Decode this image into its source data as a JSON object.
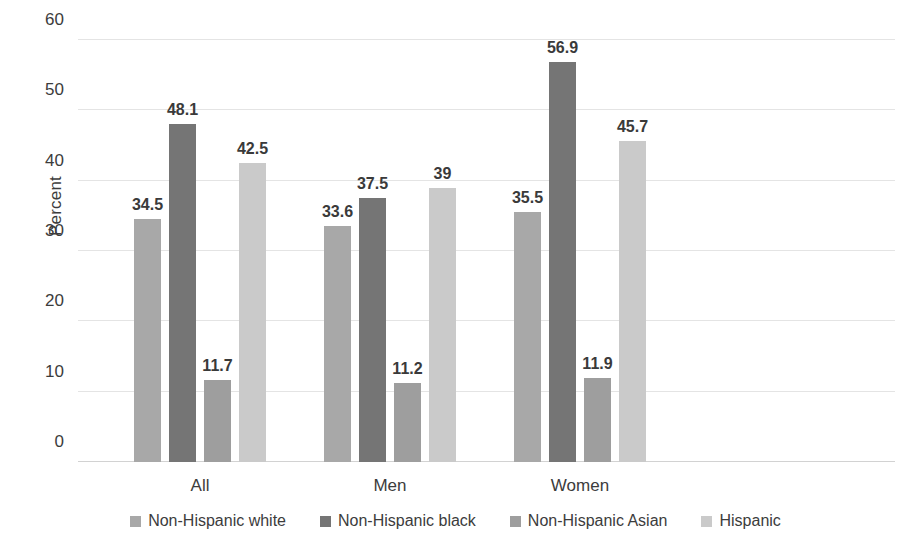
{
  "chart_data": {
    "type": "bar",
    "title": "",
    "xlabel": "",
    "ylabel": "Percent",
    "ylim": [
      0,
      60
    ],
    "ytick_step": 10,
    "yticks": [
      0,
      10,
      20,
      30,
      40,
      50,
      60
    ],
    "grid": true,
    "legend_position": "bottom",
    "categories": [
      "All",
      "Men",
      "Women"
    ],
    "series": [
      {
        "name": "Non-Hispanic white",
        "color": "#a8a8a8",
        "values": [
          34.5,
          33.6,
          35.5
        ],
        "labels": [
          "34.5",
          "33.6",
          "35.5"
        ]
      },
      {
        "name": "Non-Hispanic black",
        "color": "#757575",
        "values": [
          48.1,
          37.5,
          56.9
        ],
        "labels": [
          "48.1",
          "37.5",
          "56.9"
        ]
      },
      {
        "name": "Non-Hispanic Asian",
        "color": "#9e9e9e",
        "values": [
          11.7,
          11.2,
          11.9
        ],
        "labels": [
          "11.7",
          "11.2",
          "11.9"
        ]
      },
      {
        "name": "Hispanic",
        "color": "#cacaca",
        "values": [
          42.5,
          39.0,
          45.7
        ],
        "labels": [
          "42.5",
          "39",
          "45.7"
        ]
      }
    ]
  },
  "caption_sliver": "· · · · · · · · · · · · · · · · ·"
}
